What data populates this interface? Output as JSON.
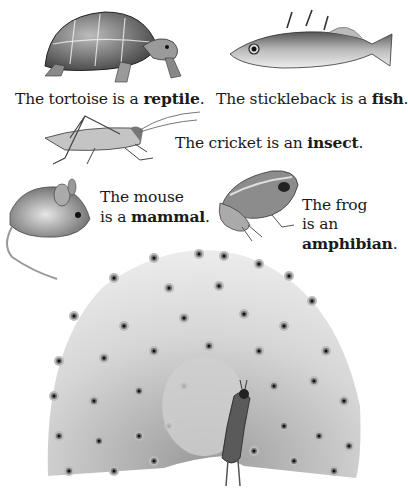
{
  "page": {
    "top_cut_text": "",
    "captions": [
      {
        "id": "tortoise",
        "prefix": "The tortoise is a ",
        "term": "reptile",
        "suffix": "."
      },
      {
        "id": "stickleback",
        "prefix": "The stickleback is a ",
        "term": "fish",
        "suffix": "."
      },
      {
        "id": "cricket",
        "prefix": "The cricket is an ",
        "term": "insect",
        "suffix": "."
      },
      {
        "id": "mouse",
        "line1": "The mouse",
        "prefix": "is a ",
        "term": "mammal",
        "suffix": "."
      },
      {
        "id": "frog",
        "line1": "The frog",
        "line2": "is an",
        "term": "amphibian",
        "suffix": "."
      }
    ],
    "illustrations": [
      {
        "id": "tortoise",
        "icon": "tortoise-illustration"
      },
      {
        "id": "stickleback",
        "icon": "fish-illustration"
      },
      {
        "id": "cricket",
        "icon": "cricket-illustration"
      },
      {
        "id": "mouse",
        "icon": "mouse-illustration"
      },
      {
        "id": "frog",
        "icon": "frog-illustration"
      },
      {
        "id": "peacock",
        "icon": "peacock-illustration"
      }
    ]
  },
  "colors": {
    "ink": "#1a1a1a",
    "shade_dark": "#4a4a4a",
    "shade_mid": "#8a8a8a",
    "shade_light": "#c8c8c8",
    "background": "#ffffff"
  }
}
